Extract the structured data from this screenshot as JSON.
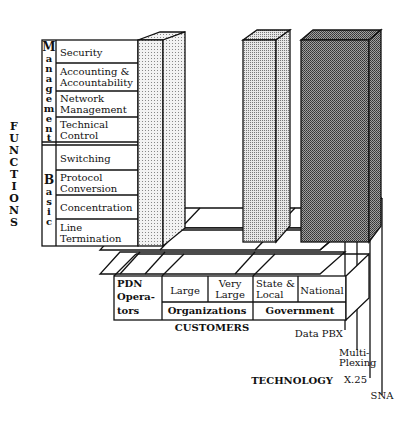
{
  "diagram": {
    "functions_axis_label": "FUNCTIONS",
    "customers_axis_label": "CUSTOMERS",
    "technology_axis_label": "TECHNOLOGY",
    "function_groups": [
      {
        "name": "Management",
        "letters": [
          "M",
          "a",
          "n",
          "a",
          "g",
          "e",
          "m",
          "e",
          "n",
          "t"
        ],
        "items": [
          "Security",
          "Accounting &",
          "Accountability",
          "Network",
          "Management",
          "Technical",
          "Control"
        ]
      },
      {
        "name": "Basic",
        "letters": [
          "B",
          "a",
          "s",
          "i",
          "c"
        ],
        "items": [
          "Switching",
          "Protocol",
          "Conversion",
          "Concentration",
          "Line",
          "Termination"
        ]
      }
    ],
    "functions": [
      "Security",
      "Accounting & Accountability",
      "Network Management",
      "Technical Control",
      "Switching",
      "Protocol Conversion",
      "Concentration",
      "Line Termination"
    ],
    "customers": {
      "pdn": [
        "PDN",
        "Opera-",
        "tors"
      ],
      "large": "Large",
      "very_large": [
        "Very",
        "Large"
      ],
      "organizations": "Organizations",
      "state_local": [
        "State &",
        "Local"
      ],
      "national": "National",
      "government": "Government"
    },
    "technology": {
      "data_pbx": "Data PBX",
      "multiplexing": [
        "Multi-",
        "Plexing"
      ],
      "x25": "X.25",
      "sna": "SNA"
    },
    "bars": [
      {
        "customer": "PDN Operators",
        "shade": "light-dots",
        "color": "#d8d8d8"
      },
      {
        "customer": "State & Local",
        "shade": "medium-dots",
        "color": "#bdbdbd"
      },
      {
        "customer": "National",
        "shade": "dark-dots",
        "color": "#8a8a8a"
      }
    ]
  }
}
